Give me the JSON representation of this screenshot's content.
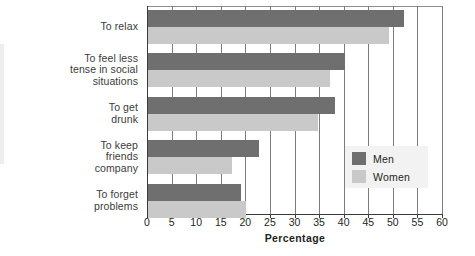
{
  "chart_data": {
    "type": "bar",
    "orientation": "horizontal",
    "title": "",
    "xlabel": "Percentage",
    "ylabel": "",
    "xlim": [
      0,
      60
    ],
    "xticks": [
      0,
      5,
      10,
      15,
      20,
      25,
      30,
      35,
      40,
      45,
      50,
      55,
      60
    ],
    "xtick_labels": [
      "0",
      "5",
      "10",
      "15",
      "20",
      "25",
      "30",
      "35",
      "40",
      "45",
      "50",
      "55",
      "60"
    ],
    "grid": "vertical",
    "legend_position": "center-right",
    "categories": [
      "To relax",
      "To feel less\ntense in social\nsituations",
      "To get\ndrunk",
      "To keep\nfriends\ncompany",
      "To forget\nproblems"
    ],
    "series": [
      {
        "name": "Men",
        "color": "#6f6f6f",
        "values": [
          52,
          40,
          38,
          22.5,
          19
        ]
      },
      {
        "name": "Women",
        "color": "#c9c9c9",
        "values": [
          49,
          37,
          34.5,
          17,
          20
        ]
      }
    ]
  },
  "legend": {
    "items": [
      {
        "label": "Men"
      },
      {
        "label": "Women"
      }
    ]
  }
}
